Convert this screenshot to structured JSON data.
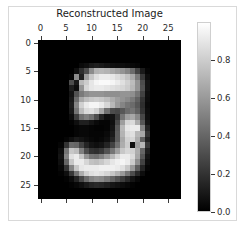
{
  "figure": {
    "background_color": "#ffffff",
    "border_color": "#d9d9d9",
    "width": 245,
    "height": 241
  },
  "chart_data": {
    "type": "heatmap",
    "title": "Reconstructed Image",
    "xlabel": "",
    "ylabel": "",
    "colormap": "gray",
    "grid": false,
    "legend_position": "right-colorbar",
    "xlim": [
      -0.5,
      27.5
    ],
    "ylim": [
      27.5,
      -0.5
    ],
    "x_ticks": [
      0,
      5,
      10,
      15,
      20,
      25
    ],
    "x_tick_labels": [
      "0",
      "5",
      "10",
      "15",
      "20",
      "25"
    ],
    "y_ticks": [
      0,
      5,
      10,
      15,
      20,
      25
    ],
    "y_tick_labels": [
      "0",
      "5",
      "10",
      "15",
      "20",
      "25"
    ],
    "colorbar": {
      "vmin": 0.0,
      "vmax": 1.0,
      "ticks": [
        0.0,
        0.2,
        0.4,
        0.6,
        0.8
      ],
      "tick_labels": [
        "0.0",
        "0.2",
        "0.4",
        "0.6",
        "0.8"
      ],
      "low_color": "#000000",
      "high_color": "#ffffff"
    },
    "shape": [
      28,
      28
    ],
    "values": [
      [
        0.0,
        0.0,
        0.0,
        0.0,
        0.0,
        0.0,
        0.0,
        0.0,
        0.0,
        0.0,
        0.0,
        0.0,
        0.0,
        0.0,
        0.0,
        0.0,
        0.0,
        0.0,
        0.0,
        0.0,
        0.0,
        0.0,
        0.0,
        0.0,
        0.0,
        0.0,
        0.0,
        0.0
      ],
      [
        0.0,
        0.0,
        0.0,
        0.0,
        0.0,
        0.0,
        0.0,
        0.0,
        0.0,
        0.0,
        0.0,
        0.0,
        0.0,
        0.0,
        0.0,
        0.0,
        0.0,
        0.0,
        0.0,
        0.0,
        0.0,
        0.0,
        0.0,
        0.0,
        0.0,
        0.0,
        0.0,
        0.0
      ],
      [
        0.0,
        0.0,
        0.0,
        0.0,
        0.0,
        0.0,
        0.0,
        0.0,
        0.0,
        0.0,
        0.0,
        0.0,
        0.0,
        0.0,
        0.0,
        0.0,
        0.0,
        0.0,
        0.0,
        0.0,
        0.0,
        0.0,
        0.0,
        0.0,
        0.0,
        0.0,
        0.0,
        0.0
      ],
      [
        0.0,
        0.0,
        0.0,
        0.0,
        0.0,
        0.0,
        0.0,
        0.0,
        0.0,
        0.0,
        0.0,
        0.0,
        0.0,
        0.0,
        0.0,
        0.0,
        0.0,
        0.0,
        0.0,
        0.0,
        0.0,
        0.0,
        0.0,
        0.0,
        0.0,
        0.0,
        0.0,
        0.0
      ],
      [
        0.0,
        0.0,
        0.0,
        0.0,
        0.0,
        0.0,
        0.0,
        0.0,
        0.04,
        0.06,
        0.1,
        0.12,
        0.1,
        0.08,
        0.06,
        0.05,
        0.05,
        0.04,
        0.03,
        0.02,
        0.0,
        0.0,
        0.0,
        0.0,
        0.0,
        0.0,
        0.0,
        0.0
      ],
      [
        0.0,
        0.0,
        0.0,
        0.0,
        0.0,
        0.0,
        0.0,
        0.06,
        0.18,
        0.3,
        0.55,
        0.7,
        0.72,
        0.7,
        0.66,
        0.62,
        0.58,
        0.52,
        0.42,
        0.26,
        0.1,
        0.02,
        0.0,
        0.0,
        0.0,
        0.0,
        0.0,
        0.0
      ],
      [
        0.0,
        0.0,
        0.0,
        0.0,
        0.0,
        0.0,
        0.02,
        0.55,
        0.12,
        0.62,
        0.78,
        0.88,
        0.92,
        0.92,
        0.9,
        0.86,
        0.82,
        0.76,
        0.66,
        0.48,
        0.22,
        0.05,
        0.0,
        0.0,
        0.0,
        0.0,
        0.0,
        0.0
      ],
      [
        0.0,
        0.0,
        0.0,
        0.0,
        0.0,
        0.0,
        0.3,
        0.1,
        0.72,
        0.8,
        0.9,
        0.96,
        0.98,
        0.98,
        0.96,
        0.92,
        0.88,
        0.82,
        0.74,
        0.58,
        0.3,
        0.08,
        0.0,
        0.0,
        0.0,
        0.0,
        0.0,
        0.0
      ],
      [
        0.0,
        0.0,
        0.0,
        0.0,
        0.0,
        0.0,
        0.12,
        0.05,
        0.58,
        0.84,
        0.9,
        0.92,
        0.92,
        0.9,
        0.88,
        0.86,
        0.84,
        0.8,
        0.72,
        0.58,
        0.32,
        0.08,
        0.0,
        0.0,
        0.0,
        0.0,
        0.0,
        0.0
      ],
      [
        0.0,
        0.0,
        0.0,
        0.0,
        0.0,
        0.0,
        0.08,
        0.32,
        0.48,
        0.55,
        0.58,
        0.58,
        0.58,
        0.56,
        0.56,
        0.56,
        0.58,
        0.58,
        0.56,
        0.46,
        0.26,
        0.06,
        0.0,
        0.0,
        0.0,
        0.0,
        0.0,
        0.0
      ],
      [
        0.0,
        0.0,
        0.0,
        0.0,
        0.0,
        0.0,
        0.1,
        0.42,
        0.66,
        0.74,
        0.78,
        0.8,
        0.78,
        0.74,
        0.68,
        0.62,
        0.58,
        0.54,
        0.48,
        0.38,
        0.2,
        0.05,
        0.0,
        0.0,
        0.0,
        0.0,
        0.0,
        0.0
      ],
      [
        0.0,
        0.0,
        0.0,
        0.0,
        0.0,
        0.0,
        0.12,
        0.52,
        0.82,
        0.92,
        0.96,
        0.96,
        0.92,
        0.84,
        0.72,
        0.6,
        0.52,
        0.46,
        0.42,
        0.34,
        0.18,
        0.04,
        0.0,
        0.0,
        0.0,
        0.0,
        0.0,
        0.0
      ],
      [
        0.0,
        0.0,
        0.0,
        0.0,
        0.0,
        0.0,
        0.1,
        0.46,
        0.74,
        0.86,
        0.88,
        0.82,
        0.66,
        0.44,
        0.3,
        0.28,
        0.34,
        0.42,
        0.46,
        0.38,
        0.2,
        0.05,
        0.0,
        0.0,
        0.0,
        0.0,
        0.0,
        0.0
      ],
      [
        0.0,
        0.0,
        0.0,
        0.0,
        0.0,
        0.0,
        0.05,
        0.24,
        0.44,
        0.5,
        0.44,
        0.3,
        0.14,
        0.06,
        0.08,
        0.22,
        0.46,
        0.62,
        0.66,
        0.54,
        0.28,
        0.06,
        0.0,
        0.0,
        0.0,
        0.0,
        0.0,
        0.0
      ],
      [
        0.0,
        0.0,
        0.0,
        0.0,
        0.0,
        0.0,
        0.01,
        0.06,
        0.12,
        0.12,
        0.08,
        0.04,
        0.02,
        0.02,
        0.06,
        0.28,
        0.62,
        0.84,
        0.86,
        0.68,
        0.34,
        0.08,
        0.0,
        0.0,
        0.0,
        0.0,
        0.0,
        0.0
      ],
      [
        0.0,
        0.0,
        0.0,
        0.0,
        0.0,
        0.0,
        0.0,
        0.02,
        0.03,
        0.03,
        0.02,
        0.01,
        0.01,
        0.02,
        0.08,
        0.34,
        0.72,
        0.9,
        0.92,
        0.92,
        0.52,
        0.14,
        0.0,
        0.0,
        0.0,
        0.0,
        0.0,
        0.0
      ],
      [
        0.0,
        0.0,
        0.0,
        0.0,
        0.0,
        0.0,
        0.0,
        0.02,
        0.03,
        0.03,
        0.02,
        0.02,
        0.02,
        0.04,
        0.1,
        0.36,
        0.7,
        0.86,
        0.88,
        0.72,
        0.66,
        0.2,
        0.0,
        0.0,
        0.0,
        0.0,
        0.0,
        0.0
      ],
      [
        0.0,
        0.0,
        0.0,
        0.0,
        0.0,
        0.02,
        0.06,
        0.1,
        0.08,
        0.05,
        0.03,
        0.02,
        0.03,
        0.06,
        0.14,
        0.36,
        0.66,
        0.82,
        0.84,
        0.68,
        0.38,
        0.12,
        0.0,
        0.0,
        0.0,
        0.0,
        0.0,
        0.0
      ],
      [
        0.0,
        0.0,
        0.0,
        0.0,
        0.02,
        0.2,
        0.42,
        0.4,
        0.26,
        0.14,
        0.08,
        0.06,
        0.08,
        0.14,
        0.26,
        0.44,
        0.68,
        0.8,
        0.06,
        0.62,
        0.72,
        0.22,
        0.0,
        0.0,
        0.0,
        0.0,
        0.0,
        0.0
      ],
      [
        0.0,
        0.0,
        0.0,
        0.0,
        0.06,
        0.46,
        0.78,
        0.74,
        0.5,
        0.3,
        0.2,
        0.18,
        0.22,
        0.32,
        0.46,
        0.62,
        0.78,
        0.84,
        0.82,
        0.68,
        0.4,
        0.12,
        0.0,
        0.0,
        0.0,
        0.0,
        0.0,
        0.0
      ],
      [
        0.0,
        0.0,
        0.0,
        0.0,
        0.08,
        0.52,
        0.88,
        0.92,
        0.78,
        0.58,
        0.46,
        0.44,
        0.5,
        0.6,
        0.72,
        0.84,
        0.92,
        0.92,
        0.86,
        0.66,
        0.34,
        0.08,
        0.0,
        0.0,
        0.0,
        0.0,
        0.0,
        0.0
      ],
      [
        0.0,
        0.0,
        0.0,
        0.0,
        0.06,
        0.4,
        0.78,
        0.92,
        0.92,
        0.84,
        0.76,
        0.74,
        0.78,
        0.84,
        0.9,
        0.94,
        0.96,
        0.92,
        0.8,
        0.56,
        0.26,
        0.05,
        0.0,
        0.0,
        0.0,
        0.0,
        0.0,
        0.0
      ],
      [
        0.0,
        0.0,
        0.0,
        0.0,
        0.03,
        0.2,
        0.52,
        0.78,
        0.9,
        0.92,
        0.92,
        0.92,
        0.94,
        0.94,
        0.94,
        0.92,
        0.88,
        0.78,
        0.6,
        0.36,
        0.14,
        0.02,
        0.0,
        0.0,
        0.0,
        0.0,
        0.0,
        0.0
      ],
      [
        0.0,
        0.0,
        0.0,
        0.0,
        0.01,
        0.06,
        0.22,
        0.46,
        0.68,
        0.82,
        0.88,
        0.9,
        0.88,
        0.84,
        0.78,
        0.7,
        0.6,
        0.46,
        0.3,
        0.16,
        0.05,
        0.0,
        0.0,
        0.0,
        0.0,
        0.0,
        0.0,
        0.0
      ],
      [
        0.0,
        0.0,
        0.0,
        0.0,
        0.0,
        0.01,
        0.05,
        0.14,
        0.28,
        0.42,
        0.52,
        0.56,
        0.54,
        0.48,
        0.4,
        0.32,
        0.24,
        0.16,
        0.08,
        0.03,
        0.0,
        0.0,
        0.0,
        0.0,
        0.0,
        0.0,
        0.0,
        0.0
      ],
      [
        0.0,
        0.0,
        0.0,
        0.0,
        0.0,
        0.0,
        0.01,
        0.03,
        0.06,
        0.1,
        0.14,
        0.16,
        0.15,
        0.12,
        0.09,
        0.07,
        0.05,
        0.03,
        0.01,
        0.0,
        0.0,
        0.0,
        0.0,
        0.0,
        0.0,
        0.0,
        0.0,
        0.0
      ],
      [
        0.0,
        0.0,
        0.0,
        0.0,
        0.0,
        0.0,
        0.0,
        0.0,
        0.0,
        0.0,
        0.0,
        0.0,
        0.0,
        0.0,
        0.0,
        0.0,
        0.0,
        0.0,
        0.0,
        0.0,
        0.0,
        0.0,
        0.0,
        0.0,
        0.0,
        0.0,
        0.0,
        0.0
      ],
      [
        0.0,
        0.0,
        0.0,
        0.0,
        0.0,
        0.0,
        0.0,
        0.0,
        0.0,
        0.0,
        0.0,
        0.0,
        0.0,
        0.0,
        0.0,
        0.0,
        0.0,
        0.0,
        0.0,
        0.0,
        0.0,
        0.0,
        0.0,
        0.0,
        0.0,
        0.0,
        0.0,
        0.0
      ]
    ]
  }
}
